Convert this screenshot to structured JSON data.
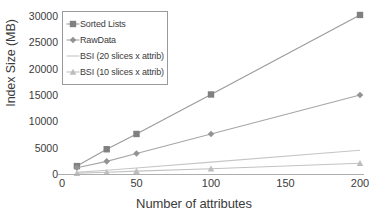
{
  "chart_data": {
    "type": "line",
    "title": "",
    "xlabel": "Number of attributes",
    "ylabel": "Index Size (MB)",
    "xlim": [
      0,
      200
    ],
    "ylim": [
      0,
      30000
    ],
    "x_ticks": [
      "0",
      "50",
      "100",
      "150",
      "200"
    ],
    "x_tick_values": [
      0,
      50,
      100,
      150,
      200
    ],
    "y_ticks": [
      "0",
      "5000",
      "10000",
      "15000",
      "20000",
      "25000",
      "30000"
    ],
    "y_tick_values": [
      0,
      5000,
      10000,
      15000,
      20000,
      25000,
      30000
    ],
    "grid": false,
    "legend_position": "upper-left",
    "x": [
      10,
      30,
      50,
      100,
      200
    ],
    "series": [
      {
        "name": "Sorted Lists",
        "values": [
          1500,
          4700,
          7600,
          15100,
          30200
        ],
        "marker": "square",
        "color": "#808080",
        "line_color": "#9a9a9a"
      },
      {
        "name": "RawData",
        "values": [
          1200,
          2400,
          3900,
          7600,
          15000
        ],
        "marker": "diamond",
        "color": "#939393",
        "line_color": "#a6a6a6"
      },
      {
        "name": "BSI (20 slices x attrib)",
        "values": [
          300,
          700,
          1150,
          2250,
          4500
        ],
        "marker": "none",
        "color": "#c6c6c6",
        "line_color": "#c6c6c6"
      },
      {
        "name": "BSI (10 slices x attrib)",
        "values": [
          130,
          320,
          540,
          1000,
          2050
        ],
        "marker": "triangle",
        "color": "#bdbdbd",
        "line_color": "#c2c2c2"
      }
    ]
  },
  "colors": {
    "axis": "#adadad",
    "text": "#3b3b3b",
    "legend_border": "#9a9a9a",
    "background": "#ffffff"
  }
}
